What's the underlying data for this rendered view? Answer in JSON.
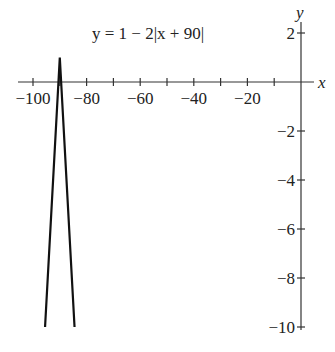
{
  "chart_data": {
    "type": "line",
    "title": "y = 1 − 2|x + 90|",
    "equation": "y = 1 - 2|x + 90|",
    "xlabel": "x",
    "ylabel": "y",
    "xlim": [
      -102,
      0
    ],
    "ylim": [
      -10,
      2.5
    ],
    "x_ticks": [
      -100,
      -90,
      -80,
      -70,
      -60,
      -50,
      -40,
      -30,
      -20,
      -10
    ],
    "x_tick_labels": [
      "−100",
      "−80",
      "−60",
      "−40",
      "−20"
    ],
    "y_ticks": [
      2,
      -2,
      -4,
      -6,
      -8,
      -10
    ],
    "y_tick_labels": [
      "2",
      "−2",
      "−4",
      "−6",
      "−8",
      "−10"
    ],
    "grid": false,
    "series": [
      {
        "name": "y = 1 - 2|x + 90|",
        "x": [
          -95.5,
          -90,
          -84.5
        ],
        "y": [
          -10,
          1,
          -10
        ]
      }
    ]
  },
  "labels": {
    "equation": "y = 1 − 2|x + 90|",
    "x_axis": "x",
    "y_axis": "y"
  }
}
